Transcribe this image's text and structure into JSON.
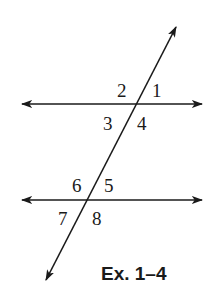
{
  "figure": {
    "caption": "Ex. 1–4",
    "angle_labels": {
      "a1": "1",
      "a2": "2",
      "a3": "3",
      "a4": "4",
      "a5": "5",
      "a6": "6",
      "a7": "7",
      "a8": "8"
    },
    "elements": [
      "parallel-line-top",
      "parallel-line-bottom",
      "transversal"
    ],
    "stroke_color": "#1a1a1a"
  }
}
